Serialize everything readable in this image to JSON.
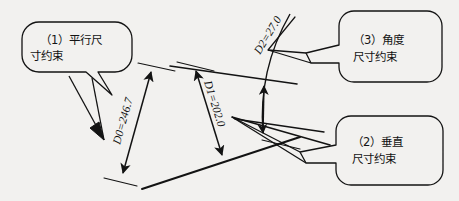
{
  "figure": {
    "background_color": "#f2f1ef",
    "ink_color": "#131313"
  },
  "callouts": [
    {
      "id": "callout-parallel",
      "number": "（1）",
      "line1": "（1）平行尺",
      "line2": "寸约束",
      "full_text": "（1）平行尺寸约束"
    },
    {
      "id": "callout-vertical",
      "number": "（2）",
      "line1": "（2）垂直",
      "line2": "尺寸约束",
      "full_text": "（2）垂直尺寸约束"
    },
    {
      "id": "callout-angle",
      "number": "（3）",
      "line1": "（3）角度",
      "line2": "尺寸约束",
      "full_text": "（3）角度尺寸约束"
    }
  ],
  "dimensions": [
    {
      "id": "dimension-d0",
      "label": "D0=246.7",
      "name": "D0",
      "value": "246.7",
      "type": "linear-parallel"
    },
    {
      "id": "dimension-d1",
      "label": "D1=202.0",
      "name": "D1",
      "value": "202.0",
      "type": "linear-vertical"
    },
    {
      "id": "dimension-d2",
      "label": "D2=27.0",
      "name": "D2",
      "value": "27.0",
      "type": "angular"
    }
  ]
}
